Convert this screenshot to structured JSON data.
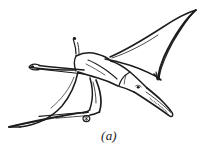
{
  "figure": {
    "caption": "(a)",
    "subject_label": "pterodactyl-flying",
    "background_color": "#ffffff",
    "ink_color": "#1c1c1c",
    "style": "line-drawing",
    "canvas": {
      "width": 218,
      "height": 154
    },
    "parts": [
      {
        "name": "right-wing-membrane",
        "label": "Right wing"
      },
      {
        "name": "left-wing-membrane",
        "label": "Left wing"
      },
      {
        "name": "head-and-beak",
        "label": "Head and beak"
      },
      {
        "name": "head-crest",
        "label": "Head crest"
      },
      {
        "name": "torso",
        "label": "Body"
      },
      {
        "name": "wing-finger-claw",
        "label": "Wing claw"
      },
      {
        "name": "left-arm-claw",
        "label": "Left arm claw"
      },
      {
        "name": "hind-limbs",
        "label": "Hind limbs"
      },
      {
        "name": "foot-toe",
        "label": "Foot"
      }
    ]
  }
}
